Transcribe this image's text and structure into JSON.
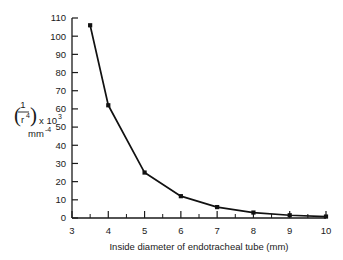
{
  "chart_data": {
    "type": "line",
    "title": "",
    "subtitle": "",
    "xlabel": "Inside diameter of endotracheal tube (mm)",
    "ylabel": "(1/r^4) x 10^3 mm^-4",
    "ylabel_parts": {
      "numerator": "1",
      "denominator": "r",
      "denominator_exponent": "4",
      "multiplier": "x 10",
      "multiplier_exponent": "3",
      "units": "mm",
      "units_exponent": "-4"
    },
    "x": [
      3.5,
      4,
      5,
      6,
      7,
      8,
      9,
      10
    ],
    "values": [
      106,
      62,
      25,
      12,
      6,
      3,
      1.5,
      0.8
    ],
    "xlim": [
      3,
      10
    ],
    "ylim": [
      0,
      110
    ],
    "xticks": [
      3,
      4,
      5,
      6,
      7,
      8,
      9,
      10
    ],
    "xtick_labels": [
      "3",
      "4",
      "5",
      "6",
      "7",
      "8",
      "9",
      "10"
    ],
    "xminor_ticks": [
      3.5,
      4.5,
      5.5,
      6.5,
      7.5,
      8.5,
      9.5
    ],
    "yticks": [
      0,
      10,
      20,
      30,
      40,
      50,
      60,
      70,
      80,
      90,
      100,
      110
    ],
    "ytick_labels": [
      "0",
      "10",
      "20",
      "30",
      "40",
      "50",
      "60",
      "70",
      "80",
      "90",
      "100",
      "110"
    ],
    "grid": false,
    "legend": null,
    "marker": "square",
    "line_color": "#111111",
    "marker_color": "#111111",
    "background_color": "#ffffff"
  }
}
